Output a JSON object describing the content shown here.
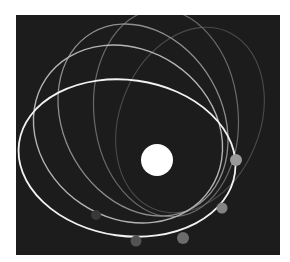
{
  "diagram": {
    "background_color": "#1c1c1c",
    "central_body": {
      "cx": 157,
      "cy": 160,
      "r": 16,
      "color": "#ffffff"
    },
    "orbits": [
      {
        "cx": 127,
        "cy": 158,
        "rx": 109,
        "ry": 78,
        "rotate": 8,
        "color": "#f2f2f2",
        "width": 1.8
      },
      {
        "cx": 128,
        "cy": 134,
        "rx": 99,
        "ry": 84,
        "rotate": 34,
        "color": "#b4b4b4",
        "width": 1.4
      },
      {
        "cx": 143,
        "cy": 120,
        "rx": 101,
        "ry": 79,
        "rotate": 60,
        "color": "#8e8e8e",
        "width": 1.3
      },
      {
        "cx": 166,
        "cy": 113,
        "rx": 104,
        "ry": 72,
        "rotate": 84,
        "color": "#6a6a6a",
        "width": 1.2
      },
      {
        "cx": 190,
        "cy": 120,
        "rx": 96,
        "ry": 70,
        "rotate": 112,
        "color": "#4a4a4a",
        "width": 1.1
      }
    ],
    "planets": [
      {
        "cx": 236,
        "cy": 160,
        "r": 6,
        "color": "#9a9a9a"
      },
      {
        "cx": 222,
        "cy": 208,
        "r": 5.5,
        "color": "#838383"
      },
      {
        "cx": 183,
        "cy": 238,
        "r": 6,
        "color": "#6c6c6c"
      },
      {
        "cx": 136,
        "cy": 241,
        "r": 5.5,
        "color": "#525252"
      },
      {
        "cx": 96,
        "cy": 215,
        "r": 5,
        "color": "#383838"
      }
    ]
  }
}
